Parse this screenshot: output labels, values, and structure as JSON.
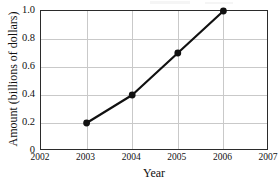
{
  "chart_data": {
    "type": "line",
    "title": "",
    "xlabel": "Year",
    "ylabel": "Amount (billions of dollars)",
    "x": [
      2003,
      2004,
      2005,
      2006
    ],
    "values": [
      0.2,
      0.4,
      0.7,
      1.0
    ],
    "series": [
      {
        "name": "Amount",
        "x": [
          2003,
          2004,
          2005,
          2006
        ],
        "values": [
          0.2,
          0.4,
          0.7,
          1.0
        ]
      }
    ],
    "xlim": [
      2002,
      2007
    ],
    "ylim": [
      0,
      1.0
    ],
    "xticks": [
      2002,
      2003,
      2004,
      2005,
      2006,
      2007
    ],
    "xtick_labels": [
      "2002",
      "2003",
      "2004",
      "2005",
      "2006",
      "2007"
    ],
    "yticks": [
      0,
      0.2,
      0.4,
      0.6,
      0.8,
      1.0
    ],
    "ytick_labels": [
      "0",
      "0.2",
      "0.4",
      "0.6",
      "0.8",
      "1.0"
    ],
    "grid": true,
    "legend": false,
    "legend_position": "none",
    "line_color": "#111111",
    "marker_color": "#111111",
    "grid_color": "#c9c9c9",
    "frame_color": "#2b2b2b"
  }
}
